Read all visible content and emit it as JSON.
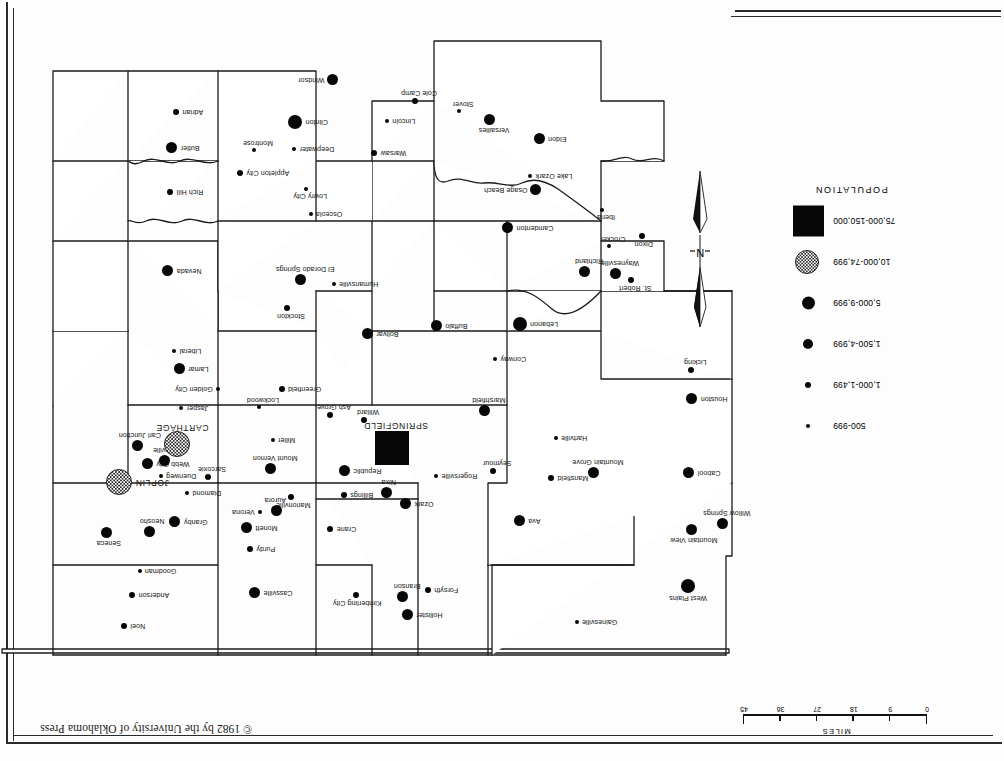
{
  "page": {
    "copyright": "© 1982 by the University of Oklahoma Press",
    "orientation": "upside-down-scan"
  },
  "scale": {
    "caption": "MILES",
    "ticks": [
      "0",
      "9",
      "18",
      "27",
      "36",
      "45"
    ]
  },
  "north_arrow": {
    "letter": "N"
  },
  "legend": {
    "title": "POPULATION",
    "items": [
      {
        "label": "500-999",
        "symbol": "small-circle",
        "size": 4
      },
      {
        "label": "1,000-1,499",
        "symbol": "circle",
        "size": 6
      },
      {
        "label": "1,500-4,999",
        "symbol": "circle",
        "size": 10
      },
      {
        "label": "5,000-9,999",
        "symbol": "circle",
        "size": 13
      },
      {
        "label": "10,000-74,999",
        "symbol": "stippled-circle",
        "size": 22
      },
      {
        "label": "75,000-150,000",
        "symbol": "filled-square",
        "size": 31
      }
    ]
  },
  "chart_data": {
    "type": "scatter",
    "xlabel": "",
    "ylabel": "",
    "legend_position": "left",
    "grid": false,
    "classes": [
      "500-999",
      "1,000-1,499",
      "1,500-4,999",
      "5,000-9,999",
      "10,000-74,999",
      "75,000-150,000"
    ],
    "points": [
      {
        "name": "West Plains",
        "class": "5,000-9,999",
        "x": 316,
        "y": 175
      },
      {
        "name": "Gainesville",
        "class": "500-999",
        "x": 427,
        "y": 139
      },
      {
        "name": "Mountain View",
        "class": "1,500-4,999",
        "x": 312,
        "y": 231
      },
      {
        "name": "Willow Springs",
        "class": "1,500-4,999",
        "x": 281,
        "y": 237
      },
      {
        "name": "Ava",
        "class": "1,500-4,999",
        "x": 484,
        "y": 240
      },
      {
        "name": "Hollister",
        "class": "1,500-4,999",
        "x": 596,
        "y": 146
      },
      {
        "name": "Branson",
        "class": "1,500-4,999",
        "x": 601,
        "y": 164
      },
      {
        "name": "Forsyth",
        "class": "1,000-1,499",
        "x": 576,
        "y": 171
      },
      {
        "name": "Kimberling City",
        "class": "1,000-1,499",
        "x": 648,
        "y": 166
      },
      {
        "name": "Cassville",
        "class": "1,500-4,999",
        "x": 749,
        "y": 168
      },
      {
        "name": "Noel",
        "class": "1,000-1,499",
        "x": 880,
        "y": 135
      },
      {
        "name": "Anderson",
        "class": "1,000-1,499",
        "x": 872,
        "y": 166
      },
      {
        "name": "Goodman",
        "class": "500-999",
        "x": 864,
        "y": 190
      },
      {
        "name": "Purdy",
        "class": "1,000-1,499",
        "x": 754,
        "y": 212
      },
      {
        "name": "Crane",
        "class": "1,000-1,499",
        "x": 674,
        "y": 232
      },
      {
        "name": "Monett",
        "class": "1,500-4,999",
        "x": 757,
        "y": 233
      },
      {
        "name": "Seneca",
        "class": "1,500-4,999",
        "x": 897,
        "y": 228
      },
      {
        "name": "Neosho",
        "class": "1,500-4,999",
        "x": 854,
        "y": 229
      },
      {
        "name": "Granby",
        "class": "1,500-4,999",
        "x": 829,
        "y": 239
      },
      {
        "name": "Verona",
        "class": "500-999",
        "x": 744,
        "y": 249
      },
      {
        "name": "Aurora",
        "class": "1,500-4,999",
        "x": 727,
        "y": 250
      },
      {
        "name": "Ozark",
        "class": "1,500-4,999",
        "x": 598,
        "y": 257
      },
      {
        "name": "Nixa",
        "class": "1,500-4,999",
        "x": 617,
        "y": 268
      },
      {
        "name": "Billings",
        "class": "1,000-1,499",
        "x": 660,
        "y": 266
      },
      {
        "name": "Marionville",
        "class": "1,000-1,499",
        "x": 713,
        "y": 264
      },
      {
        "name": "Diamond",
        "class": "500-999",
        "x": 817,
        "y": 268
      },
      {
        "name": "JOPLIN",
        "class": "10,000-74,999",
        "x": 884,
        "y": 278
      },
      {
        "name": "Duenweg",
        "class": "500-999",
        "x": 843,
        "y": 285
      },
      {
        "name": "Webb City",
        "class": "1,500-4,999",
        "x": 856,
        "y": 297
      },
      {
        "name": "Sarcoxie",
        "class": "1,000-1,499",
        "x": 796,
        "y": 284
      },
      {
        "name": "Carterville",
        "class": "1,500-4,999",
        "x": 839,
        "y": 300
      },
      {
        "name": "CARTHAGE",
        "class": "10,000-74,999",
        "x": 826,
        "y": 316
      },
      {
        "name": "Carl Junction",
        "class": "1,500-4,999",
        "x": 866,
        "y": 315
      },
      {
        "name": "Cabool",
        "class": "1,500-4,999",
        "x": 315,
        "y": 288
      },
      {
        "name": "Mansfield",
        "class": "1,000-1,499",
        "x": 453,
        "y": 283
      },
      {
        "name": "Mountain Grove",
        "class": "1,500-4,999",
        "x": 410,
        "y": 288
      },
      {
        "name": "Hartville",
        "class": "500-999",
        "x": 448,
        "y": 323
      },
      {
        "name": "Seymour",
        "class": "1,000-1,499",
        "x": 511,
        "y": 290
      },
      {
        "name": "Rogersville",
        "class": "500-999",
        "x": 568,
        "y": 285
      },
      {
        "name": "Republic",
        "class": "1,500-4,999",
        "x": 659,
        "y": 290
      },
      {
        "name": "SPRINGFIELD",
        "class": "75,000-150,000",
        "x": 612,
        "y": 313
      },
      {
        "name": "Mount Vernon",
        "class": "1,500-4,999",
        "x": 733,
        "y": 292
      },
      {
        "name": "Willard",
        "class": "1,000-1,499",
        "x": 640,
        "y": 341
      },
      {
        "name": "Ash Grove",
        "class": "1,000-1,499",
        "x": 674,
        "y": 346
      },
      {
        "name": "Miller",
        "class": "500-999",
        "x": 731,
        "y": 321
      },
      {
        "name": "Houston",
        "class": "1,500-4,999",
        "x": 312,
        "y": 362
      },
      {
        "name": "Marshfield",
        "class": "1,500-4,999",
        "x": 519,
        "y": 350
      },
      {
        "name": "Lockwood",
        "class": "500-999",
        "x": 745,
        "y": 354
      },
      {
        "name": "Greenfield",
        "class": "1,000-1,499",
        "x": 722,
        "y": 372
      },
      {
        "name": "Jasper",
        "class": "500-999",
        "x": 823,
        "y": 353
      },
      {
        "name": "Golden City",
        "class": "500-999",
        "x": 786,
        "y": 372
      },
      {
        "name": "Lamar",
        "class": "1,500-4,999",
        "x": 824,
        "y": 392
      },
      {
        "name": "Liberal",
        "class": "500-999",
        "x": 830,
        "y": 410
      },
      {
        "name": "Licking",
        "class": "1,000-1,499",
        "x": 313,
        "y": 391
      },
      {
        "name": "Conway",
        "class": "500-999",
        "x": 509,
        "y": 402
      },
      {
        "name": "Lebanon",
        "class": "5,000-9,999",
        "x": 484,
        "y": 437
      },
      {
        "name": "Buffalo",
        "class": "1,500-4,999",
        "x": 567,
        "y": 435
      },
      {
        "name": "Bolivar",
        "class": "1,500-4,999",
        "x": 636,
        "y": 427
      },
      {
        "name": "Stockton",
        "class": "1,000-1,499",
        "x": 717,
        "y": 453
      },
      {
        "name": "St. Robert",
        "class": "1,000-1,499",
        "x": 373,
        "y": 481
      },
      {
        "name": "Waynesville",
        "class": "1,500-4,999",
        "x": 388,
        "y": 487
      },
      {
        "name": "Richland",
        "class": "1,500-4,999",
        "x": 419,
        "y": 489
      },
      {
        "name": "Dixon",
        "class": "1,000-1,499",
        "x": 362,
        "y": 525
      },
      {
        "name": "Crocker",
        "class": "500-999",
        "x": 395,
        "y": 515
      },
      {
        "name": "Iberia",
        "class": "500-999",
        "x": 402,
        "y": 551
      },
      {
        "name": "Camdenton",
        "class": "1,500-4,999",
        "x": 496,
        "y": 533
      },
      {
        "name": "Osage Beach",
        "class": "1,500-4,999",
        "x": 468,
        "y": 571
      },
      {
        "name": "Lake Ozark",
        "class": "500-999",
        "x": 474,
        "y": 585
      },
      {
        "name": "Humansville",
        "class": "500-999",
        "x": 670,
        "y": 477
      },
      {
        "name": "El Dorado Springs",
        "class": "1,500-4,999",
        "x": 703,
        "y": 481
      },
      {
        "name": "Nevada",
        "class": "1,500-4,999",
        "x": 836,
        "y": 490
      },
      {
        "name": "Osceola",
        "class": "500-999",
        "x": 693,
        "y": 547
      },
      {
        "name": "Lowry City",
        "class": "500-999",
        "x": 698,
        "y": 572
      },
      {
        "name": "Appleton City",
        "class": "1,000-1,499",
        "x": 764,
        "y": 588
      },
      {
        "name": "Rich Hill",
        "class": "1,000-1,499",
        "x": 834,
        "y": 569
      },
      {
        "name": "Eldon",
        "class": "1,500-4,999",
        "x": 464,
        "y": 622
      },
      {
        "name": "Versailles",
        "class": "1,500-4,999",
        "x": 514,
        "y": 641
      },
      {
        "name": "Stover",
        "class": "500-999",
        "x": 545,
        "y": 650
      },
      {
        "name": "Cole Camp",
        "class": "1,000-1,499",
        "x": 589,
        "y": 660
      },
      {
        "name": "Lincoln",
        "class": "500-999",
        "x": 617,
        "y": 640
      },
      {
        "name": "Warsaw",
        "class": "1,000-1,499",
        "x": 630,
        "y": 608
      },
      {
        "name": "Deepwater",
        "class": "500-999",
        "x": 710,
        "y": 612
      },
      {
        "name": "Montrose",
        "class": "500-999",
        "x": 750,
        "y": 611
      },
      {
        "name": "Clinton",
        "class": "5,000-9,999",
        "x": 709,
        "y": 639
      },
      {
        "name": "Windsor",
        "class": "1,500-4,999",
        "x": 671,
        "y": 681
      },
      {
        "name": "Butler",
        "class": "1,500-4,999",
        "x": 832,
        "y": 613
      },
      {
        "name": "Adrian",
        "class": "1,000-1,499",
        "x": 828,
        "y": 649
      }
    ]
  }
}
